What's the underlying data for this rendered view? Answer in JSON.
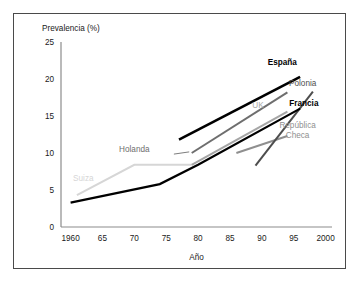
{
  "chart_data": {
    "type": "line",
    "title": "",
    "xlabel": "Año",
    "ylabel": "Prevalencia (%)",
    "xlim": [
      1958.5,
      2001
    ],
    "ylim": [
      0,
      25
    ],
    "grid": false,
    "legend_position": "inline-labels",
    "xticks": [
      1960,
      1965,
      1970,
      1975,
      1980,
      1985,
      1990,
      1995,
      2000
    ],
    "xtick_labels": [
      "1960",
      "65",
      "70",
      "75",
      "80",
      "85",
      "90",
      "95",
      "2000"
    ],
    "yticks": [
      0,
      5,
      10,
      15,
      20,
      25
    ],
    "ytick_labels": [
      "0",
      "5",
      "10",
      "15",
      "20",
      "25"
    ],
    "series": [
      {
        "name": "España",
        "label": "España",
        "color": "#000000",
        "width": 2.6,
        "bold_label": true,
        "label_x": 1993.2,
        "label_y": 21.9,
        "x": [
          1977,
          1996
        ],
        "values": [
          11.8,
          20.3
        ]
      },
      {
        "name": "Francia",
        "label": "Francia",
        "color": "#000000",
        "width": 2.2,
        "bold_label": true,
        "label_x": 1996.6,
        "label_y": 16.3,
        "x": [
          1960,
          1974,
          1980,
          1996
        ],
        "values": [
          3.3,
          5.8,
          8.4,
          16.0
        ]
      },
      {
        "name": "Holanda",
        "label": "Holanda",
        "color": "#6e6e6e",
        "width": 2.0,
        "bold_label": false,
        "label_x": 1970.0,
        "label_y": 10.1,
        "x": [
          1979,
          1994
        ],
        "values": [
          10.0,
          18.2
        ]
      },
      {
        "name": "UK",
        "label": "UK",
        "color": "#a6a6a6",
        "width": 2.0,
        "bold_label": false,
        "label_x": 1989.4,
        "label_y": 16.1,
        "x": [
          1979,
          1994
        ],
        "values": [
          8.4,
          15.6
        ]
      },
      {
        "name": "Polonia",
        "label": "Polonia",
        "color": "#4d4d4d",
        "width": 2.0,
        "bold_label": false,
        "label_x": 1996.4,
        "label_y": 19.0,
        "x": [
          1989,
          1998
        ],
        "values": [
          8.3,
          18.3
        ]
      },
      {
        "name": "República Checa",
        "label_line1": "República",
        "label_line2": "Checa",
        "color": "#8f8f8f",
        "width": 2.0,
        "bold_label": false,
        "label_x": 1995.6,
        "label_y": 13.4,
        "x": [
          1986,
          1994
        ],
        "values": [
          10.0,
          12.3
        ]
      },
      {
        "name": "Suiza",
        "label": "Suiza",
        "color": "#d6d6d6",
        "width": 2.0,
        "bold_label": false,
        "label_x": 1962.0,
        "label_y": 6.2,
        "x": [
          1961,
          1970,
          1979
        ],
        "values": [
          4.3,
          8.4,
          8.4
        ]
      }
    ],
    "annotations": [
      {
        "name": "holanda-leader",
        "color": "#6e6e6e",
        "x1": 1976.2,
        "y1": 9.85,
        "x2": 1978.6,
        "y2": 10.15
      }
    ]
  }
}
